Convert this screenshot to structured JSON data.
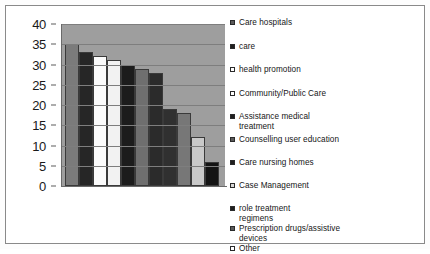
{
  "chart_data": {
    "type": "bar",
    "title": "",
    "xlabel": "",
    "ylabel": "",
    "ylim": [
      0,
      40
    ],
    "ytick_labels": [
      "40",
      "35",
      "30",
      "25",
      "20",
      "15",
      "10",
      "5",
      "0"
    ],
    "ytick_values": [
      40,
      35,
      30,
      25,
      20,
      15,
      10,
      5,
      0
    ],
    "grid": true,
    "legend_position": "right",
    "categories": [
      "Care hospitals",
      "care",
      "health promotion",
      "Community/Public Care",
      "Assistance medical treatment",
      "Counselling user education",
      "Care nursing homes",
      "Case Management",
      "role  treatment regimens",
      "Prescription drugs/assistive devices",
      "Other"
    ],
    "values": [
      35,
      33,
      32,
      31,
      30,
      29,
      28,
      19,
      18,
      12,
      6
    ],
    "bar_colors": [
      "#7b7b7b",
      "#262626",
      "#fbfbfb",
      "#f2f2f2",
      "#1c1c1c",
      "#6f6f6f",
      "#2b2b2b",
      "#303030",
      "#777777",
      "#c9c9c9",
      "#141414"
    ],
    "plot_background": "#9e9e9e",
    "gridline_color": "#7e7e7e"
  },
  "legend": {
    "items": [
      {
        "label": "Care hospitals",
        "marker": "filled",
        "swatch": "#5a5a5a"
      },
      {
        "label": "care",
        "marker": "filled",
        "swatch": "#1f1f1f"
      },
      {
        "label": "health promotion",
        "marker": "hollow",
        "swatch": "#ffffff"
      },
      {
        "label": "Community/Public Care",
        "marker": "hollow",
        "swatch": "#ffffff"
      },
      {
        "label": "Assistance medical\ntreatment",
        "marker": "filled",
        "swatch": "#1f1f1f"
      },
      {
        "label": "Counselling user education",
        "marker": "filled",
        "swatch": "#5a5a5a"
      },
      {
        "label": "Care nursing homes",
        "marker": "filled",
        "swatch": "#1f1f1f"
      },
      {
        "label": "Case Management",
        "marker": "hollow",
        "swatch": "#d8d8d8"
      },
      {
        "label": "role    treatment\nregimens",
        "marker": "filled",
        "swatch": "#1f1f1f"
      },
      {
        "label": "Prescription drugs/assistive\ndevices",
        "marker": "filled",
        "swatch": "#5a5a5a"
      },
      {
        "label": "Other",
        "marker": "hollow",
        "swatch": "#ffffff"
      }
    ]
  }
}
